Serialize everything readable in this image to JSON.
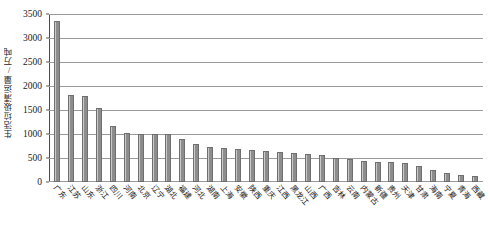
{
  "chart_data": {
    "type": "bar",
    "title": "",
    "xlabel": "",
    "ylabel": "生活垃圾清运量/万吨",
    "ylim": [
      0,
      3500
    ],
    "ytick_values": [
      0,
      500,
      1000,
      1500,
      2000,
      2500,
      3000,
      3500
    ],
    "ytick_labels": [
      "0",
      "500",
      "1000",
      "1500",
      "2000",
      "2500",
      "3000",
      "3500"
    ],
    "grid": true,
    "legend": false,
    "bar_color": "#8d8d8d",
    "bar_edge_color": "#6f6f6f",
    "categories": [
      "广东",
      "江苏",
      "山东",
      "浙江",
      "四川",
      "河南",
      "北京",
      "辽宁",
      "湖北",
      "福建",
      "河北",
      "湖南",
      "上海",
      "安徽",
      "陕西",
      "重庆",
      "江西",
      "黑龙江",
      "山西",
      "广西",
      "吉林",
      "云南",
      "内蒙古",
      "新疆",
      "贵州",
      "天津",
      "甘肃",
      "海南",
      "宁夏",
      "青海",
      "西藏"
    ],
    "values": [
      3350,
      1820,
      1790,
      1550,
      1170,
      1020,
      1010,
      1005,
      1000,
      890,
      800,
      720,
      700,
      680,
      660,
      640,
      620,
      600,
      580,
      560,
      500,
      470,
      440,
      420,
      410,
      400,
      330,
      250,
      190,
      140,
      120
    ]
  }
}
